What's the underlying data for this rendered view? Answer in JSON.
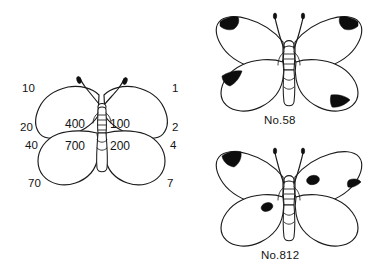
{
  "figure": {
    "type": "scientific-illustration",
    "background_color": "#ffffff",
    "ink_color": "#1b1b1b",
    "spot_color": "#0d0d0d"
  },
  "schematic": {
    "name": "scoring-schematic-butterfly",
    "left_labels": [
      {
        "id": "left-forewing-apex",
        "value": "10",
        "x": 22,
        "y": 92
      },
      {
        "id": "left-forewing-outer",
        "value": "20",
        "x": 22,
        "y": 130
      },
      {
        "id": "left-hindwing-outer",
        "value": "40",
        "x": 25,
        "y": 147
      },
      {
        "id": "left-hindwing-anal",
        "value": "70",
        "x": 28,
        "y": 185
      }
    ],
    "right_labels": [
      {
        "id": "right-forewing-apex",
        "value": "1",
        "x": 170,
        "y": 92
      },
      {
        "id": "right-forewing-outer",
        "value": "2",
        "x": 170,
        "y": 130
      },
      {
        "id": "right-hindwing-outer",
        "value": "4",
        "x": 168,
        "y": 147
      },
      {
        "id": "right-hindwing-anal",
        "value": "7",
        "x": 165,
        "y": 185
      }
    ],
    "inner_labels": [
      {
        "id": "left-forewing-inner",
        "value": "400",
        "x": 68,
        "y": 127
      },
      {
        "id": "right-forewing-inner",
        "value": "100",
        "x": 111,
        "y": 127
      },
      {
        "id": "left-hindwing-inner",
        "value": "700",
        "x": 68,
        "y": 148
      },
      {
        "id": "right-hindwing-inner",
        "value": "200",
        "x": 111,
        "y": 148
      }
    ]
  },
  "specimens": [
    {
      "id": "specimen-58",
      "caption": "No.58",
      "caption_x": 285,
      "caption_y": 121,
      "spots": [
        {
          "id": "left-forewing-apex-spot",
          "present": true
        },
        {
          "id": "right-forewing-apex-spot",
          "present": true
        },
        {
          "id": "left-hindwing-outer-spot",
          "present": true
        },
        {
          "id": "right-hindwing-anal-spot",
          "present": true
        }
      ]
    },
    {
      "id": "specimen-812",
      "caption": "No.812",
      "caption_x": 285,
      "caption_y": 256,
      "spots": [
        {
          "id": "left-forewing-apex-spot",
          "present": true
        },
        {
          "id": "right-forewing-inner-spot",
          "present": true
        },
        {
          "id": "right-forewing-outer-spot",
          "present": true
        },
        {
          "id": "left-hindwing-inner-spot",
          "present": true
        }
      ]
    }
  ]
}
